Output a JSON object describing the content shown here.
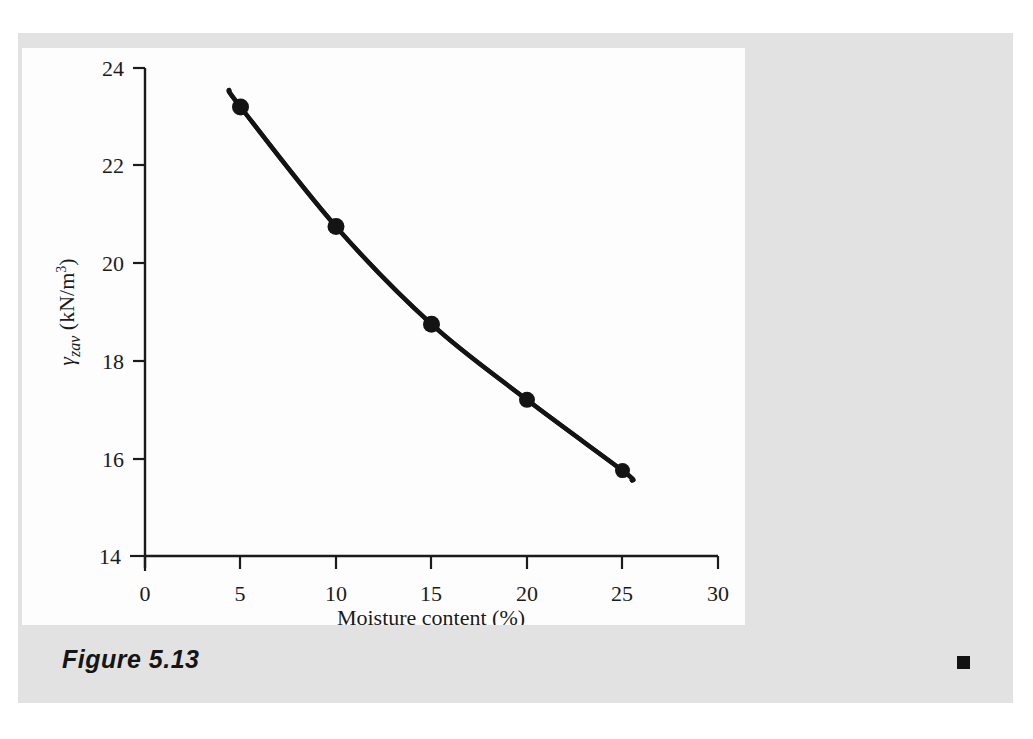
{
  "figure": {
    "caption": "Figure 5.13",
    "end_mark": "black-square"
  },
  "colors": {
    "page_background": "#ffffff",
    "sheet_background": "#e2e2e2",
    "panel_background": "#fdfdfd",
    "ink": "#1b1b1b",
    "curve": "#141414"
  },
  "chart_data": {
    "type": "line",
    "title": "",
    "xlabel": "Moisture content (%)",
    "ylabel": "γzav (kN/m3)",
    "ylabel_symbol": "γ",
    "ylabel_subscript": "zav",
    "ylabel_units": "(kN/m",
    "ylabel_units_sup": "3",
    "ylabel_units_close": ")",
    "xlim": [
      0,
      30
    ],
    "ylim": [
      14,
      24
    ],
    "xticks": [
      0,
      5,
      10,
      15,
      20,
      25,
      30
    ],
    "xtick_labels": [
      "0",
      "5",
      "10",
      "15",
      "20",
      "25",
      "30"
    ],
    "yticks": [
      14,
      16,
      18,
      20,
      22,
      24
    ],
    "ytick_labels": [
      "14",
      "16",
      "18",
      "20",
      "22",
      "24"
    ],
    "grid": false,
    "legend": false,
    "series": [
      {
        "name": "Zero-air-void unit weight",
        "marker": "filled-circle",
        "x": [
          5,
          10,
          15,
          20,
          25
        ],
        "y": [
          23.2,
          20.75,
          18.75,
          17.2,
          15.75
        ],
        "line_extends_before": {
          "x": 4.4,
          "y": 23.55
        },
        "line_extends_after": {
          "x": 25.5,
          "y": 15.55
        }
      }
    ]
  }
}
